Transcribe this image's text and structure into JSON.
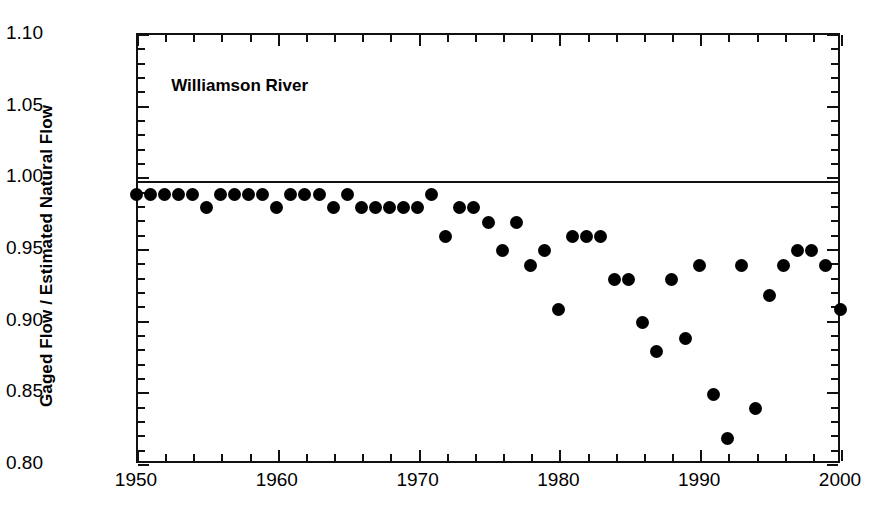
{
  "chart_data": {
    "type": "scatter",
    "title": "Williamson River",
    "xlabel": "",
    "ylabel": "Gaged Flow / Estimated Natural Flow",
    "xlim": [
      1950,
      2000
    ],
    "ylim": [
      0.8,
      1.1
    ],
    "xticks": [
      1950,
      1960,
      1970,
      1980,
      1990,
      2000
    ],
    "xtick_labels": [
      "1950",
      "1960",
      "1970",
      "1980",
      "1990",
      "2000"
    ],
    "x_minor_step": 2,
    "yticks": [
      0.8,
      0.85,
      0.9,
      0.95,
      1.0,
      1.05,
      1.1
    ],
    "ytick_labels": [
      "0.80",
      "0.85",
      "0.90",
      "0.95",
      "1.00",
      "1.05",
      "1.10"
    ],
    "y_minor_step": 0.01,
    "grid": false,
    "legend": null,
    "reference_line": {
      "y": 0.998,
      "label": "",
      "color": "#111111"
    },
    "marker": {
      "shape": "circle",
      "color": "#000000",
      "size": 13
    },
    "x": [
      1950,
      1951,
      1952,
      1953,
      1954,
      1955,
      1956,
      1957,
      1958,
      1959,
      1960,
      1961,
      1962,
      1963,
      1964,
      1965,
      1966,
      1967,
      1968,
      1969,
      1970,
      1971,
      1972,
      1973,
      1974,
      1975,
      1976,
      1977,
      1978,
      1979,
      1980,
      1981,
      1982,
      1983,
      1984,
      1985,
      1986,
      1987,
      1988,
      1989,
      1990,
      1991,
      1992,
      1993,
      1994,
      1995,
      1996,
      1997,
      1998,
      1999,
      2000
    ],
    "values": [
      0.987,
      0.987,
      0.987,
      0.987,
      0.987,
      0.978,
      0.987,
      0.987,
      0.987,
      0.987,
      0.978,
      0.987,
      0.987,
      0.987,
      0.978,
      0.987,
      0.978,
      0.978,
      0.978,
      0.978,
      0.978,
      0.987,
      0.958,
      0.978,
      0.978,
      0.968,
      0.948,
      0.968,
      0.938,
      0.948,
      0.907,
      0.958,
      0.958,
      0.958,
      0.928,
      0.928,
      0.898,
      0.878,
      0.928,
      0.887,
      0.938,
      0.848,
      0.817,
      0.938,
      0.838,
      0.917,
      0.938,
      0.948,
      0.948,
      0.938,
      0.907
    ],
    "annotations": [
      {
        "text": "Williamson River",
        "x": 1952.5,
        "y": 1.063
      }
    ]
  }
}
